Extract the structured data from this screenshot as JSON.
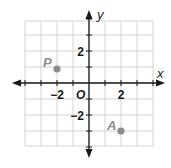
{
  "chart_data": {
    "type": "scatter",
    "title": "",
    "xlabel": "x",
    "ylabel": "y",
    "xlim": [
      -4,
      4
    ],
    "ylim": [
      -4,
      4
    ],
    "grid": true,
    "origin_label": "O",
    "x_tick_labels": [
      {
        "value": -2,
        "label": "−2"
      },
      {
        "value": 2,
        "label": "2"
      }
    ],
    "y_tick_labels": [
      {
        "value": 2,
        "label": "2"
      },
      {
        "value": -2,
        "label": "−2"
      }
    ],
    "points": [
      {
        "name": "P",
        "x": -2,
        "y": 1,
        "color": "#8c8c8c"
      },
      {
        "name": "A",
        "x": 2,
        "y": -3,
        "color": "#8c8c8c"
      }
    ]
  },
  "colors": {
    "grid": "#d4d4d4",
    "axis": "#1a1a1a",
    "point": "#8c8c8c",
    "point_label": "#8c8c8c"
  }
}
